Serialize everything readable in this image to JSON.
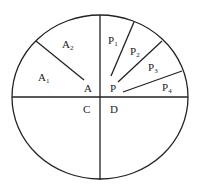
{
  "diagram": {
    "stroke_color": "#222222",
    "background": "#ffffff",
    "circle": {
      "cx": 100,
      "cy": 97,
      "rx": 88,
      "ry": 82
    },
    "axes": {
      "horizontal": {
        "x1": 12,
        "y1": 97,
        "x2": 188,
        "y2": 97
      },
      "vertical": {
        "x1": 100,
        "y1": 15,
        "x2": 100,
        "y2": 180
      }
    },
    "segments": [
      {
        "name": "A-line",
        "x1": 36,
        "y1": 41,
        "x2": 84,
        "y2": 80
      },
      {
        "name": "P-line-1",
        "x1": 111,
        "y1": 76,
        "x2": 134,
        "y2": 22
      },
      {
        "name": "P-line-2",
        "x1": 118,
        "y1": 82,
        "x2": 162,
        "y2": 41
      },
      {
        "name": "P-line-3",
        "x1": 123,
        "y1": 92,
        "x2": 182,
        "y2": 71
      }
    ],
    "labels": {
      "A1": {
        "main": "A",
        "sub": "1"
      },
      "A2": {
        "main": "A",
        "sub": "2"
      },
      "A": "A",
      "P": "P",
      "P1": {
        "main": "P",
        "sub": "1"
      },
      "P2": {
        "main": "P",
        "sub": "2"
      },
      "P3": {
        "main": "P",
        "sub": "3"
      },
      "P4": {
        "main": "P",
        "sub": "4"
      },
      "C": "C",
      "D": "D"
    }
  }
}
